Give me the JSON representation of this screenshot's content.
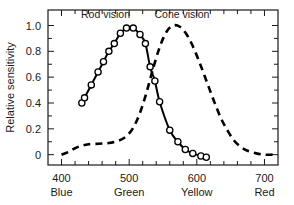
{
  "chart_data": {
    "type": "line",
    "title": "",
    "subtitle": "",
    "xlabel": "",
    "ylabel": "Relative sensitivity",
    "xlim": [
      380,
      720
    ],
    "ylim": [
      -0.08,
      1.12
    ],
    "grid": false,
    "legend_position": "inside-top",
    "x_ticks_major": [
      400,
      500,
      600,
      700
    ],
    "x_tick_labels": [
      "400",
      "500",
      "600",
      "700"
    ],
    "x_tick_sublabels": [
      "Blue",
      "Green",
      "Yellow",
      "Red"
    ],
    "x_minor_tick_step": 20,
    "y_ticks_major": [
      0,
      0.2,
      0.4,
      0.6,
      0.8,
      1.0
    ],
    "y_tick_labels": [
      "0",
      "0.2",
      "0.4",
      "0.6",
      "0.8",
      "1.0"
    ],
    "y_minor_tick_step": 0.1,
    "annotations": [
      {
        "text": "Rod vision",
        "x": 465,
        "y": 1.06
      },
      {
        "text": "Cone vision",
        "x": 578,
        "y": 1.06
      }
    ],
    "series": [
      {
        "name": "Rod vision",
        "line_style": "solid",
        "marker": "open-circle",
        "color": "#000000",
        "points": [
          {
            "x": 430,
            "y": 0.4
          },
          {
            "x": 434,
            "y": 0.44
          },
          {
            "x": 444,
            "y": 0.54
          },
          {
            "x": 454,
            "y": 0.64
          },
          {
            "x": 462,
            "y": 0.72
          },
          {
            "x": 470,
            "y": 0.8
          },
          {
            "x": 478,
            "y": 0.86
          },
          {
            "x": 487,
            "y": 0.94
          },
          {
            "x": 496,
            "y": 0.98
          },
          {
            "x": 506,
            "y": 0.98
          },
          {
            "x": 516,
            "y": 0.93
          },
          {
            "x": 524,
            "y": 0.86
          },
          {
            "x": 531,
            "y": 0.68
          },
          {
            "x": 538,
            "y": 0.57
          },
          {
            "x": 545,
            "y": 0.41
          },
          {
            "x": 560,
            "y": 0.19
          },
          {
            "x": 572,
            "y": 0.1
          },
          {
            "x": 583,
            "y": 0.04
          },
          {
            "x": 594,
            "y": 0.01
          },
          {
            "x": 606,
            "y": -0.01
          },
          {
            "x": 614,
            "y": -0.02
          }
        ]
      },
      {
        "name": "Cone vision",
        "line_style": "dashed",
        "marker": "none",
        "color": "#000000",
        "points": [
          {
            "x": 400,
            "y": 0.0
          },
          {
            "x": 410,
            "y": 0.02
          },
          {
            "x": 420,
            "y": 0.05
          },
          {
            "x": 430,
            "y": 0.07
          },
          {
            "x": 440,
            "y": 0.08
          },
          {
            "x": 455,
            "y": 0.085
          },
          {
            "x": 470,
            "y": 0.09
          },
          {
            "x": 485,
            "y": 0.11
          },
          {
            "x": 495,
            "y": 0.14
          },
          {
            "x": 505,
            "y": 0.2
          },
          {
            "x": 515,
            "y": 0.31
          },
          {
            "x": 525,
            "y": 0.47
          },
          {
            "x": 535,
            "y": 0.66
          },
          {
            "x": 545,
            "y": 0.83
          },
          {
            "x": 555,
            "y": 0.95
          },
          {
            "x": 565,
            "y": 1.0
          },
          {
            "x": 575,
            "y": 0.99
          },
          {
            "x": 585,
            "y": 0.93
          },
          {
            "x": 595,
            "y": 0.83
          },
          {
            "x": 605,
            "y": 0.7
          },
          {
            "x": 615,
            "y": 0.56
          },
          {
            "x": 625,
            "y": 0.42
          },
          {
            "x": 635,
            "y": 0.29
          },
          {
            "x": 645,
            "y": 0.19
          },
          {
            "x": 655,
            "y": 0.11
          },
          {
            "x": 665,
            "y": 0.06
          },
          {
            "x": 675,
            "y": 0.03
          },
          {
            "x": 688,
            "y": 0.01
          },
          {
            "x": 700,
            "y": 0.0
          },
          {
            "x": 712,
            "y": 0.0
          }
        ]
      }
    ]
  }
}
